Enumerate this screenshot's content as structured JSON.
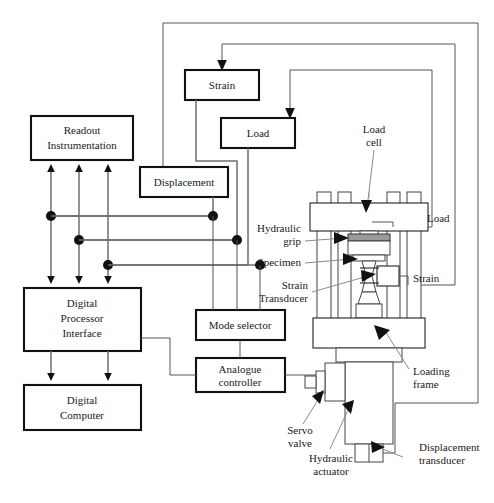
{
  "figure": {
    "type": "block-diagram"
  },
  "blocks": [
    {
      "id": "readout",
      "label_lines": [
        "Readout",
        "Instrumentation"
      ]
    },
    {
      "id": "strain",
      "label_lines": [
        "Strain"
      ]
    },
    {
      "id": "load",
      "label_lines": [
        "Load"
      ]
    },
    {
      "id": "displacement",
      "label_lines": [
        "Displacement"
      ]
    },
    {
      "id": "digital_processor",
      "label_lines": [
        "Digital",
        "Processor",
        "Interface"
      ]
    },
    {
      "id": "digital_computer",
      "label_lines": [
        "Digital",
        "Computer"
      ]
    },
    {
      "id": "mode_selector",
      "label_lines": [
        "Mode selector"
      ]
    },
    {
      "id": "analogue_controller",
      "label_lines": [
        "Analogue",
        "controller"
      ]
    }
  ],
  "block_labels": {
    "readout_1": "Readout",
    "readout_2": "Instrumentation",
    "strain": "Strain",
    "load": "Load",
    "displacement": "Displacement",
    "processor_1": "Digital",
    "processor_2": "Processor",
    "processor_3": "Interface",
    "computer_1": "Digital",
    "computer_2": "Computer",
    "mode_selector": "Mode selector",
    "analogue_1": "Analogue",
    "analogue_2": "controller"
  },
  "annotations": {
    "load_cell_1": "Load",
    "load_cell_2": "cell",
    "hydraulic_grip_1": "Hydraulic",
    "hydraulic_grip_2": "grip",
    "specimen": "Specimen",
    "strain_transducer_1": "Strain",
    "strain_transducer_2": "Transducer",
    "load_signal": "Load",
    "strain_signal": "Strain",
    "loading_frame_1": "Loading",
    "loading_frame_2": "frame",
    "servo_valve_1": "Servo",
    "servo_valve_2": "valve",
    "hydraulic_actuator_1": "Hydraulic",
    "hydraulic_actuator_2": "actuator",
    "displacement_transducer_1": "Displacement",
    "displacement_transducer_2": "transducer"
  },
  "colors": {
    "block_stroke": "#111111",
    "wire": "#6e6e6e",
    "machine_stroke": "#444444",
    "grip_fill": "#9a9a9a",
    "text": "#1a1a1a",
    "background": "#ffffff"
  }
}
